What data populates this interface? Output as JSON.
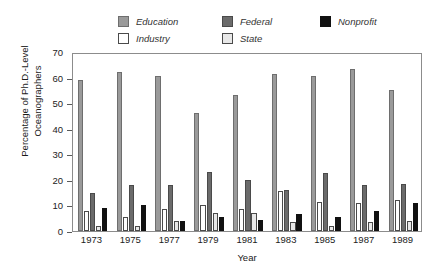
{
  "chart_data": {
    "type": "bar",
    "title": "",
    "subtitle": "",
    "xlabel": "Year",
    "ylabel": "Percentage of Ph.D.-Level Oceanographers",
    "ylabel_line1": "Percentage of Ph.D.-Level",
    "ylabel_line2": "Oceanographers",
    "ylim": [
      0,
      70
    ],
    "ytick_step": 10,
    "yticks": [
      70,
      60,
      50,
      40,
      30,
      20,
      10,
      0
    ],
    "ytick_labels": [
      "70",
      "60",
      "50",
      "40",
      "30",
      "20",
      "10",
      "0"
    ],
    "grid": false,
    "legend_position": "top",
    "categories": [
      "1973",
      "1975",
      "1977",
      "1979",
      "1981",
      "1983",
      "1985",
      "1987",
      "1989"
    ],
    "series": [
      {
        "name": "Education",
        "color": "#9a9a9a",
        "edge": "#6e6e6e",
        "values": [
          59.0,
          62.0,
          60.5,
          46.0,
          53.0,
          61.5,
          60.5,
          63.5,
          55.0
        ]
      },
      {
        "name": "Industry",
        "color": "#ffffff",
        "edge": "#4a4a4a",
        "values": [
          8.0,
          5.5,
          8.5,
          10.0,
          8.5,
          15.5,
          11.5,
          11.0,
          12.0
        ]
      },
      {
        "name": "Federal",
        "color": "#6b6b6b",
        "edge": "#4a4a4a",
        "values": [
          15.0,
          18.0,
          18.0,
          23.0,
          20.0,
          16.0,
          22.5,
          18.0,
          18.5
        ]
      },
      {
        "name": "State",
        "color": "#e8e8e8",
        "edge": "#4a4a4a",
        "values": [
          2.0,
          2.0,
          4.0,
          7.0,
          7.0,
          3.5,
          2.0,
          3.5,
          4.0
        ]
      },
      {
        "name": "Nonprofit",
        "color": "#111111",
        "edge": "#111111",
        "values": [
          9.0,
          10.0,
          4.0,
          5.5,
          4.5,
          6.5,
          5.5,
          8.0,
          11.0
        ]
      }
    ]
  },
  "legend": {
    "rows": [
      [
        {
          "label": "Education",
          "color": "#9a9a9a",
          "edge": "#6e6e6e"
        },
        {
          "label": "Federal",
          "color": "#6b6b6b",
          "edge": "#4a4a4a"
        },
        {
          "label": "Nonprofit",
          "color": "#111111",
          "edge": "#111111"
        }
      ],
      [
        {
          "label": "Industry",
          "color": "#ffffff",
          "edge": "#4a4a4a"
        },
        {
          "label": "State",
          "color": "#e8e8e8",
          "edge": "#4a4a4a"
        }
      ]
    ]
  },
  "axes": {
    "y_title_line1": "Percentage of Ph.D.-Level",
    "y_title_line2": "Oceanographers",
    "x_title": "Year"
  }
}
